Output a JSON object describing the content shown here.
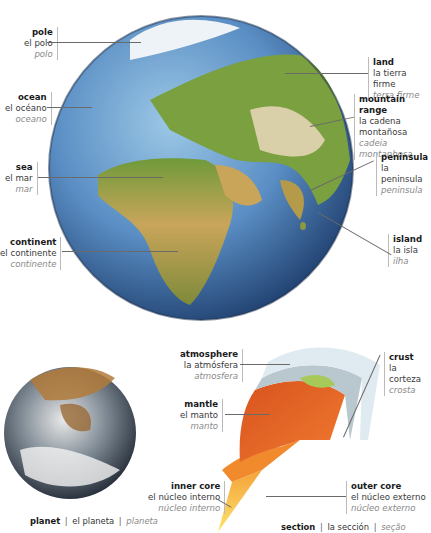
{
  "globe": {
    "labels": [
      {
        "id": "pole",
        "en": "pole",
        "es": "el polo",
        "pt": "polo"
      },
      {
        "id": "ocean",
        "en": "ocean",
        "es": "el océano",
        "pt": "oceano"
      },
      {
        "id": "sea",
        "en": "sea",
        "es": "el mar",
        "pt": "mar"
      },
      {
        "id": "continent",
        "en": "continent",
        "es": "el continente",
        "pt": "continente"
      },
      {
        "id": "land",
        "en": "land",
        "es": "la tierra firme",
        "pt": "terra firme"
      },
      {
        "id": "mountain-range",
        "en": "mountain range",
        "es": "la cadena",
        "es2": "montañosa",
        "pt": "cadeia montanhosa"
      },
      {
        "id": "peninsula",
        "en": "peninsula",
        "es": "la peninsula",
        "pt": "peninsula"
      },
      {
        "id": "island",
        "en": "island",
        "es": "la isla",
        "pt": "ilha"
      }
    ]
  },
  "planet": {
    "caption": {
      "en": "planet",
      "sep": "|",
      "es": "el planeta",
      "pt": "planeta"
    }
  },
  "section": {
    "labels": [
      {
        "id": "atmosphere",
        "en": "atmosphere",
        "es": "la atmósfera",
        "pt": "atmosfera"
      },
      {
        "id": "mantle",
        "en": "mantle",
        "es": "el manto",
        "pt": "manto"
      },
      {
        "id": "inner-core",
        "en": "inner core",
        "es": "el núcleo interno",
        "pt": "núcleo interno"
      },
      {
        "id": "crust",
        "en": "crust",
        "es": "la corteza",
        "pt": "crosta"
      },
      {
        "id": "outer-core",
        "en": "outer core",
        "es": "el núcleo externo",
        "pt": "núcleo externo"
      }
    ],
    "caption": {
      "en": "section",
      "sep": "|",
      "es": "la sección",
      "pt": "seção"
    }
  },
  "colors": {
    "ocean": "#3f6fa8",
    "ocean_light": "#8cc0e0",
    "land_green": "#6f9a3a",
    "land_sand": "#c9a55a",
    "ice": "#eef3f7",
    "crust": "#b9c7cf",
    "mantle": "#e0652a",
    "outer_core": "#f08a2c",
    "inner_core": "#f6c73a"
  }
}
